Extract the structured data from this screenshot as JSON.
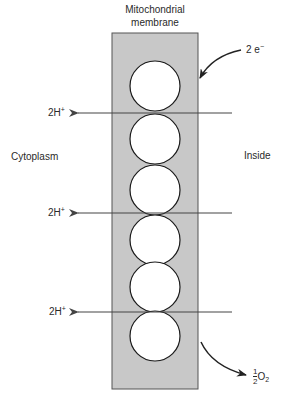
{
  "diagram": {
    "title_line1": "Mitochondrial",
    "title_line2": "membrane",
    "left_region": "Cytoplasm",
    "right_region": "Inside",
    "electron_input": {
      "coef": "2",
      "symbol": "e",
      "charge": "−"
    },
    "proton_labels": [
      {
        "coef": "2H",
        "charge": "+"
      },
      {
        "coef": "2H",
        "charge": "+"
      },
      {
        "coef": "2H",
        "charge": "+"
      }
    ],
    "oxygen_output": {
      "num": "1",
      "den": "2",
      "species": "O",
      "subscript": "2"
    },
    "carrier_count": 6,
    "colors": {
      "membrane_fill": "#c8c8c8",
      "stroke": "#1a1a1a",
      "arrow": "#444444"
    }
  }
}
